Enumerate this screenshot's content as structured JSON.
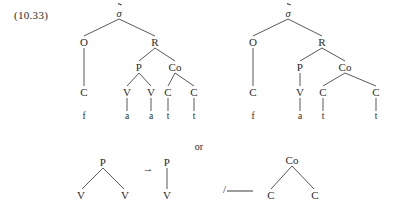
{
  "figure": {
    "example_number": "(10.33)",
    "conjunction": "or",
    "arrow": "→",
    "environment": {
      "slash": "/",
      "blank": ""
    }
  },
  "labels": {
    "sigma": "σ",
    "onset": "O",
    "rhyme": "R",
    "peak": "P",
    "coda": "Co",
    "consonant": "C",
    "vowel": "V",
    "seg_f": "f",
    "seg_a": "a",
    "seg_t": "t"
  },
  "tree_left": {
    "name": "syllable-tree-geminate-vowel",
    "nodes": [
      {
        "id": "sigma",
        "label": "σ",
        "accented": true,
        "x": 119,
        "y": 14,
        "kind": "sigma"
      },
      {
        "id": "onset",
        "label": "O",
        "x": 84,
        "y": 42,
        "kind": "nt"
      },
      {
        "id": "rhyme",
        "label": "R",
        "x": 155,
        "y": 42,
        "kind": "nt"
      },
      {
        "id": "onset-c",
        "label": "C",
        "x": 84,
        "y": 92,
        "kind": "nt"
      },
      {
        "id": "onset-seg",
        "label": "f",
        "x": 84,
        "y": 117,
        "kind": "leaf"
      },
      {
        "id": "peak",
        "label": "P",
        "x": 139,
        "y": 67,
        "kind": "nt"
      },
      {
        "id": "coda",
        "label": "Co",
        "x": 175,
        "y": 67,
        "kind": "nt"
      },
      {
        "id": "peak-v1",
        "label": "V",
        "x": 127,
        "y": 92,
        "kind": "nt"
      },
      {
        "id": "peak-v2",
        "label": "V",
        "x": 151,
        "y": 92,
        "kind": "nt"
      },
      {
        "id": "peak-seg1",
        "label": "a",
        "x": 127,
        "y": 117,
        "kind": "leaf"
      },
      {
        "id": "peak-seg2",
        "label": "a",
        "x": 151,
        "y": 117,
        "kind": "leaf"
      },
      {
        "id": "coda-c1",
        "label": "C",
        "x": 168,
        "y": 92,
        "kind": "nt"
      },
      {
        "id": "coda-c2",
        "label": "C",
        "x": 194,
        "y": 92,
        "kind": "nt"
      },
      {
        "id": "coda-seg1",
        "label": "t",
        "x": 168,
        "y": 117,
        "kind": "leaf"
      },
      {
        "id": "coda-seg2",
        "label": "t",
        "x": 194,
        "y": 117,
        "kind": "leaf"
      }
    ],
    "edges": [
      [
        119,
        19,
        84,
        36
      ],
      [
        119,
        19,
        155,
        36
      ],
      [
        84,
        48,
        84,
        86
      ],
      [
        155,
        48,
        139,
        61
      ],
      [
        155,
        48,
        175,
        61
      ],
      [
        139,
        73,
        127,
        86
      ],
      [
        139,
        73,
        151,
        86
      ],
      [
        127,
        98,
        127,
        111
      ],
      [
        151,
        98,
        151,
        111
      ],
      [
        175,
        73,
        168,
        86
      ],
      [
        175,
        73,
        194,
        86
      ],
      [
        168,
        98,
        168,
        111
      ],
      [
        194,
        98,
        194,
        111
      ]
    ]
  },
  "tree_right": {
    "name": "syllable-tree-single-vowel",
    "nodes": [
      {
        "id": "sigma",
        "label": "σ",
        "accented": true,
        "x": 288,
        "y": 14,
        "kind": "sigma"
      },
      {
        "id": "onset",
        "label": "O",
        "x": 253,
        "y": 42,
        "kind": "nt"
      },
      {
        "id": "rhyme",
        "label": "R",
        "x": 322,
        "y": 42,
        "kind": "nt"
      },
      {
        "id": "onset-c",
        "label": "C",
        "x": 253,
        "y": 92,
        "kind": "nt"
      },
      {
        "id": "onset-seg",
        "label": "f",
        "x": 253,
        "y": 117,
        "kind": "leaf"
      },
      {
        "id": "peak",
        "label": "P",
        "x": 300,
        "y": 67,
        "kind": "nt"
      },
      {
        "id": "coda",
        "label": "Co",
        "x": 345,
        "y": 67,
        "kind": "nt"
      },
      {
        "id": "peak-v",
        "label": "V",
        "x": 300,
        "y": 92,
        "kind": "nt"
      },
      {
        "id": "peak-seg",
        "label": "a",
        "x": 300,
        "y": 117,
        "kind": "leaf"
      },
      {
        "id": "coda-c1",
        "label": "C",
        "x": 323,
        "y": 92,
        "kind": "nt"
      },
      {
        "id": "coda-c2",
        "label": "C",
        "x": 376,
        "y": 92,
        "kind": "nt"
      },
      {
        "id": "coda-seg1",
        "label": "t",
        "x": 323,
        "y": 117,
        "kind": "leaf"
      },
      {
        "id": "coda-seg2",
        "label": "t",
        "x": 376,
        "y": 117,
        "kind": "leaf"
      }
    ],
    "edges": [
      [
        288,
        19,
        253,
        36
      ],
      [
        288,
        19,
        322,
        36
      ],
      [
        253,
        48,
        253,
        86
      ],
      [
        322,
        48,
        300,
        61
      ],
      [
        322,
        48,
        345,
        61
      ],
      [
        300,
        73,
        300,
        86
      ],
      [
        300,
        98,
        300,
        111
      ],
      [
        345,
        73,
        323,
        86
      ],
      [
        345,
        73,
        376,
        86
      ],
      [
        323,
        98,
        323,
        111
      ],
      [
        376,
        98,
        376,
        111
      ]
    ]
  },
  "rule": {
    "name": "degemination-rule",
    "input": {
      "nodes": [
        {
          "id": "p",
          "label": "P",
          "x": 103,
          "y": 162,
          "kind": "nt"
        },
        {
          "id": "v1",
          "label": "V",
          "x": 81,
          "y": 195,
          "kind": "nt"
        },
        {
          "id": "v2",
          "label": "V",
          "x": 125,
          "y": 195,
          "kind": "nt"
        }
      ],
      "edges": [
        [
          103,
          168,
          82,
          189
        ],
        [
          103,
          168,
          124,
          189
        ]
      ]
    },
    "output": {
      "nodes": [
        {
          "id": "p",
          "label": "P",
          "x": 167,
          "y": 162,
          "kind": "nt"
        },
        {
          "id": "v",
          "label": "V",
          "x": 167,
          "y": 195,
          "kind": "nt"
        }
      ],
      "edges": [
        [
          167,
          168,
          167,
          189
        ]
      ]
    },
    "arrow_pos": {
      "x": 148,
      "y": 168
    },
    "environment_pos": {
      "x": 238,
      "y": 189
    },
    "context": {
      "nodes": [
        {
          "id": "coda",
          "label": "Co",
          "x": 292,
          "y": 160,
          "kind": "nt"
        },
        {
          "id": "c1",
          "label": "C",
          "x": 271,
          "y": 195,
          "kind": "nt"
        },
        {
          "id": "c2",
          "label": "C",
          "x": 315,
          "y": 195,
          "kind": "nt"
        }
      ],
      "edges": [
        [
          292,
          166,
          271,
          189
        ],
        [
          292,
          166,
          314,
          189
        ]
      ]
    }
  },
  "conjunction_pos": {
    "x": 199,
    "y": 146
  }
}
